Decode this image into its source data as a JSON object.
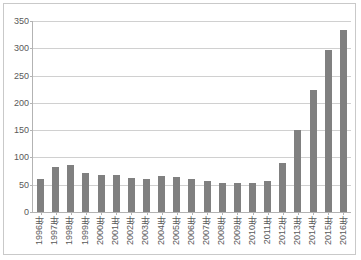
{
  "chart_data": {
    "type": "bar",
    "title": "",
    "xlabel": "",
    "ylabel": "",
    "ylim": [
      0,
      350
    ],
    "yticks": [
      0,
      50,
      100,
      150,
      200,
      250,
      300,
      350
    ],
    "ytick_labels": [
      "0",
      "50",
      "100",
      "150",
      "200",
      "250",
      "300",
      "350"
    ],
    "grid": true,
    "legend": "none",
    "bar_color": "#808080",
    "gridline_color": "#d0d0d0",
    "axis_color": "#b3b3b3",
    "categories": [
      "1996年",
      "1997年",
      "1998年",
      "1999年",
      "2000年",
      "2001年",
      "2002年",
      "2003年",
      "2004年",
      "2005年",
      "2006年",
      "2007年",
      "2008年",
      "2009年",
      "2010年",
      "2011年",
      "2012年",
      "2013年",
      "2014年",
      "2015年",
      "2016年"
    ],
    "values": [
      60,
      83,
      86,
      71,
      68,
      68,
      63,
      61,
      66,
      65,
      60,
      57,
      53,
      54,
      54,
      57,
      89,
      150,
      224,
      296,
      334
    ],
    "series": [
      {
        "name": "",
        "values": [
          60,
          83,
          86,
          71,
          68,
          68,
          63,
          61,
          66,
          65,
          60,
          57,
          53,
          54,
          54,
          57,
          89,
          150,
          224,
          296,
          334
        ]
      }
    ]
  }
}
